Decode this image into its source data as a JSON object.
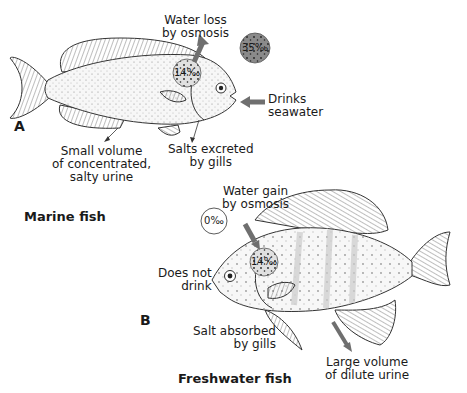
{
  "panel_a": {
    "letter": "A",
    "title": "Marine fish",
    "labels": {
      "water_loss_line1": "Water loss",
      "water_loss_line2": "by osmosis",
      "drinks_line1": "Drinks",
      "drinks_line2": "seawater",
      "salts_line1": "Salts excreted",
      "salts_line2": "by gills",
      "urine_line1": "Small volume",
      "urine_line2": "of concentrated,",
      "urine_line3": "salty urine"
    },
    "concentrations": {
      "external": "35‰",
      "internal": "14‰"
    }
  },
  "panel_b": {
    "letter": "B",
    "title": "Freshwater fish",
    "labels": {
      "water_gain_line1": "Water gain",
      "water_gain_line2": "by osmosis",
      "no_drink_line1": "Does not",
      "no_drink_line2": "drink",
      "salt_line1": "Salt absorbed",
      "salt_line2": "by gills",
      "urine_line1": "Large volume",
      "urine_line2": "of dilute urine"
    },
    "concentrations": {
      "external": "0‰",
      "internal": "14‰"
    }
  },
  "colors": {
    "arrow": "#6f6f6f",
    "external_circle_marine": "#8a8a8a",
    "line": "#333333"
  }
}
